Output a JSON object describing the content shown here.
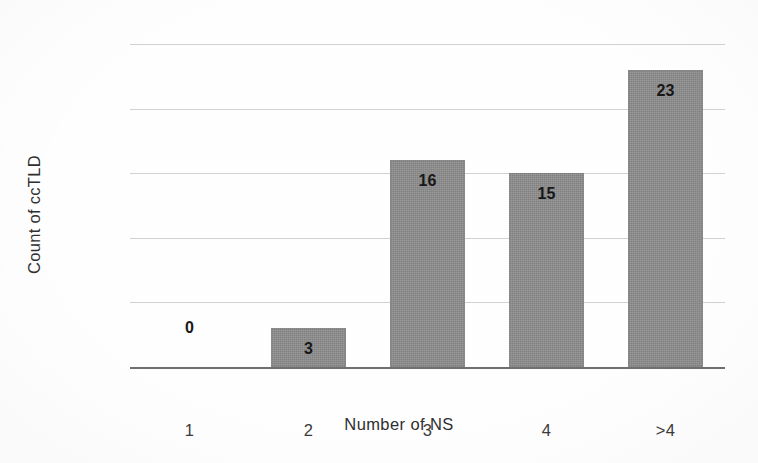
{
  "chart_data": {
    "type": "bar",
    "title": "",
    "categories": [
      "1",
      "2",
      "3",
      "4",
      ">4"
    ],
    "values": [
      0,
      3,
      16,
      15,
      23
    ],
    "data_labels": [
      "0",
      "3",
      "16",
      "15",
      "23"
    ],
    "xlabel": "Number of NS",
    "ylabel": "Count of ccTLD",
    "ylim": [
      0,
      25
    ],
    "ytick_labels": [
      "0",
      "5",
      "10",
      "15",
      "20",
      "25"
    ],
    "ytick_values": [
      0,
      5,
      10,
      15,
      20,
      25
    ],
    "grid": "horizontal",
    "legend": "none",
    "bar_color": "#8c8c8c",
    "gridline_color": "#c9c9c9",
    "axis_color": "#6f6f6f",
    "text_color": "#2f2f2f"
  }
}
